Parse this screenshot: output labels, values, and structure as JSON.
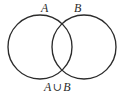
{
  "figure": {
    "kind": "venn-diagram",
    "background_color": "#ffffff",
    "stroke_color": "#2b2b2b",
    "labels": {
      "set_a": "A",
      "set_b": "B",
      "caption_left": "A",
      "caption_operator": "∪",
      "caption_right": "B",
      "caption_full": "A ∪ B"
    },
    "circles": [
      {
        "name": "set-a-circle",
        "label": "A",
        "cx": 40,
        "cy": 47,
        "r": 32
      },
      {
        "name": "set-b-circle",
        "label": "B",
        "cx": 84,
        "cy": 47,
        "r": 32
      }
    ]
  },
  "chart_data": {
    "type": "diagram",
    "diagram_type": "venn",
    "sets": [
      "A",
      "B"
    ],
    "relation": "union",
    "shaded_regions": [],
    "region_labels": [
      "A ∪ B"
    ],
    "annotations": [
      "A",
      "B",
      "A ∪ B"
    ]
  }
}
